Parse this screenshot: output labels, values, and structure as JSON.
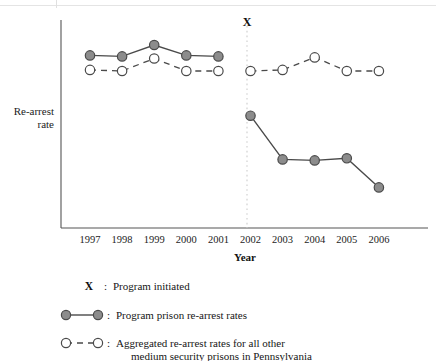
{
  "chart_data": {
    "type": "line",
    "title": "",
    "xlabel": "Year",
    "ylabel_line1": "Re-arrest",
    "ylabel_line2": "rate",
    "categories": [
      "1997",
      "1998",
      "1999",
      "2000",
      "2001",
      "2002",
      "2003",
      "2004",
      "2005",
      "2006"
    ],
    "x": [
      1997,
      1998,
      1999,
      2000,
      2001,
      2002,
      2003,
      2004,
      2005,
      2006
    ],
    "ylim": [
      0,
      100
    ],
    "y_axis_ticks_shown": false,
    "grid": false,
    "legend_position": "below-plot",
    "annotations": [
      {
        "name": "program-initiated-marker",
        "label": "X",
        "x": 2002,
        "description": "Program initiated",
        "line_style": "dotted-vertical"
      }
    ],
    "series": [
      {
        "name": "Program prison re-arrest rates",
        "key": "program",
        "marker": "filled-circle",
        "line_style": "solid",
        "color": "#8c8c8c",
        "line_color": "#4a4a4a",
        "segments": [
          {
            "period": "pre-program",
            "x": [
              1997,
              1998,
              1999,
              2000,
              2001
            ],
            "values": [
              83,
              82.5,
              88,
              83,
              82.5
            ]
          },
          {
            "period": "post-program",
            "x": [
              2002,
              2003,
              2004,
              2005,
              2006
            ],
            "values": [
              54,
              33,
              32.5,
              33.5,
              19.5
            ]
          }
        ]
      },
      {
        "name": "Aggregated re-arrest rates for all other medium security prisons in Pennsylvania",
        "key": "aggregated",
        "marker": "open-circle",
        "line_style": "dashed",
        "color": "#ffffff",
        "line_color": "#4a4a4a",
        "segments": [
          {
            "period": "pre-program",
            "x": [
              1997,
              1998,
              1999,
              2000,
              2001
            ],
            "values": [
              76,
              75.5,
              81.5,
              75.5,
              75.5
            ]
          },
          {
            "period": "post-program",
            "x": [
              2002,
              2003,
              2004,
              2005,
              2006
            ],
            "values": [
              75.5,
              76,
              82,
              75.5,
              75.5
            ]
          }
        ]
      }
    ]
  },
  "legend": {
    "items": [
      {
        "key": "program-initiated",
        "symbol": "X",
        "separator": ":",
        "label": "Program initiated"
      },
      {
        "key": "program-rates",
        "symbol": "filled-circle-solid-line",
        "separator": ":",
        "label": "Program prison re-arrest rates"
      },
      {
        "key": "aggregated-rates",
        "symbol": "open-circle-dashed-line",
        "separator": ":",
        "label_line1": "Aggregated re-arrest rates for all other",
        "label_line2": "medium security prisons in Pennsylvania"
      }
    ]
  },
  "colors": {
    "marker_fill": "#8c8c8c",
    "marker_stroke": "#4a4a4a",
    "line": "#4a4a4a",
    "axis": "#555555",
    "divider": "#d8d8d8",
    "text": "#1a1a1a",
    "background": "#ffffff"
  }
}
